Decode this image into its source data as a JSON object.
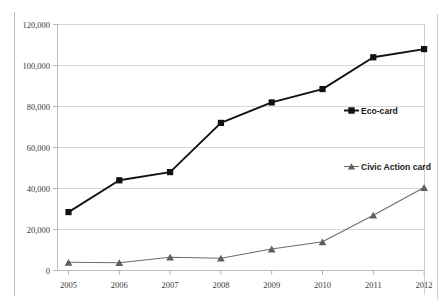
{
  "chart_data": {
    "type": "line",
    "title": "",
    "subtitle": "",
    "xlabel": "",
    "ylabel": "",
    "categories": [
      "2005",
      "2006",
      "2007",
      "2008",
      "2009",
      "2010",
      "2011",
      "2012"
    ],
    "x": [
      2005,
      2006,
      2007,
      2008,
      2009,
      2010,
      2011,
      2012
    ],
    "ylim": [
      0,
      120000
    ],
    "xlim": [
      2005,
      2012
    ],
    "ytick_labels": [
      "0",
      "20,000",
      "40,000",
      "60,000",
      "80,000",
      "100,000",
      "120,000"
    ],
    "ytick_values": [
      0,
      20000,
      40000,
      60000,
      80000,
      100000,
      120000
    ],
    "grid": "horizontal",
    "legend_position": "inline-right",
    "series": [
      {
        "name": "Eco-card",
        "marker": "square",
        "color": "#111111",
        "values": [
          28500,
          44000,
          48000,
          72000,
          82000,
          88500,
          104000,
          108000
        ]
      },
      {
        "name": "Civic Action card",
        "marker": "triangle",
        "color": "#6d6d6d",
        "values": [
          4000,
          3800,
          6500,
          6000,
          10500,
          14000,
          27000,
          40500
        ]
      }
    ]
  },
  "legend": {
    "eco_label": "Eco-card",
    "civic_label": "Civic Action card"
  },
  "axes": {
    "y_ticks": [
      {
        "label": "120,000"
      },
      {
        "label": "100,000"
      },
      {
        "label": "80,000"
      },
      {
        "label": "60,000"
      },
      {
        "label": "40,000"
      },
      {
        "label": "20,000"
      },
      {
        "label": "0"
      }
    ],
    "x_ticks": [
      {
        "label": "2005"
      },
      {
        "label": "2006"
      },
      {
        "label": "2007"
      },
      {
        "label": "2008"
      },
      {
        "label": "2009"
      },
      {
        "label": "2010"
      },
      {
        "label": "2011"
      },
      {
        "label": "2012"
      }
    ]
  },
  "colors": {
    "background": "#ffffff",
    "gridline": "#d4d4d4",
    "axis": "#b6b6b6",
    "eco_series": "#111111",
    "civic_series": "#6d6d6d",
    "tick_text": "#3a3a3a",
    "legend_text": "#1a1a1a"
  }
}
